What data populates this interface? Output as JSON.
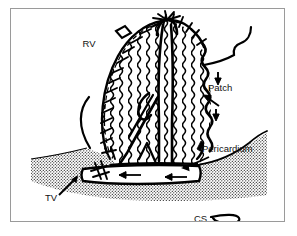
{
  "figure": {
    "domain": "medical-illustration",
    "frame": {
      "border_color": "#9a9a9a",
      "background_color": "#ffffff",
      "ink_color": "#000000"
    },
    "labels": [
      {
        "id": "rv",
        "text": "RV",
        "x": 78,
        "y": 38,
        "anchor": "middle",
        "size": "normal"
      },
      {
        "id": "patch",
        "text": "Patch",
        "x": 197,
        "y": 82,
        "anchor": "start",
        "size": "normal"
      },
      {
        "id": "pericardium",
        "text": "Pericardium",
        "x": 191,
        "y": 143,
        "anchor": "start",
        "size": "normal"
      },
      {
        "id": "tv",
        "text": "TV",
        "x": 34,
        "y": 192,
        "anchor": "start",
        "size": "normal"
      },
      {
        "id": "cs",
        "text": "CS",
        "x": 183,
        "y": 213,
        "anchor": "start",
        "size": "normal"
      }
    ],
    "structures": [
      {
        "id": "patch-body",
        "name": "Corrugated pericardial patch",
        "description": "Large oval wavy-hatched patch occupying the centre of the field"
      },
      {
        "id": "suture-line-left",
        "name": "Running suture line, left border"
      },
      {
        "id": "suture-line-top",
        "name": "Running suture line, superior border"
      },
      {
        "id": "pericardium-floor",
        "name": "Stippled pericardial tissue at base"
      },
      {
        "id": "coronary-sinus",
        "name": "Coronary sinus tube with flow arrows"
      },
      {
        "id": "tv-annulus",
        "name": "Tricuspid valve annulus arc"
      },
      {
        "id": "pointer-patch",
        "name": "Leader line to patch"
      },
      {
        "id": "pointer-pericardium",
        "name": "Leader line to pericardium"
      },
      {
        "id": "pointer-tv",
        "name": "Leader arrow to tricuspid valve"
      },
      {
        "id": "pointer-cs",
        "name": "Leader loop to coronary sinus"
      }
    ],
    "annotations": {
      "flow_arrow_count": 2,
      "patch_arrow_count": 2
    }
  }
}
